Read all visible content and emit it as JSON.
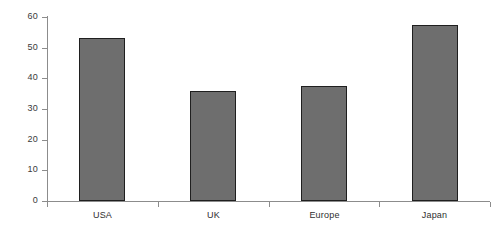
{
  "chart_data": {
    "type": "bar",
    "title": "",
    "subtitle": "",
    "xlabel": "",
    "ylabel": "",
    "categories": [
      "USA",
      "UK",
      "Europe",
      "Japan"
    ],
    "values": [
      53,
      36,
      37.5,
      57.5
    ],
    "series": [
      {
        "name": "",
        "values": [
          53,
          36,
          37.5,
          57.5
        ]
      }
    ],
    "ylim": [
      0,
      60
    ],
    "yticks": [
      0,
      10,
      20,
      30,
      40,
      50,
      60
    ],
    "ytick_labels": [
      "0",
      "10",
      "20",
      "30",
      "40",
      "50",
      "60"
    ],
    "xtick_labels": [
      "USA",
      "UK",
      "Europe",
      "Japan"
    ],
    "grid": false,
    "legend": false,
    "legend_position": "none",
    "annotations": [],
    "colors": {
      "bar_fill": "#6e6e6e",
      "bar_edge": "#1f1f1f",
      "axis": "#8c8c8c",
      "tick_label": "#3a3a3a",
      "background": "#ffffff"
    }
  }
}
